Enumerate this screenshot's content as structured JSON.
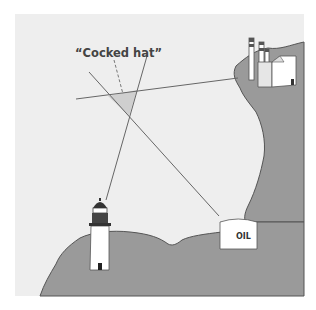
{
  "diagram": {
    "title_label": "“Cocked hat”",
    "oil_label": "OIL",
    "landmarks": [
      "lighthouse",
      "oil-tank",
      "power-station-chimneys"
    ],
    "colors": {
      "sea": "#eeeeee",
      "land": "#9a9a9a",
      "coast_line": "#555555",
      "bearing_line": "#666666",
      "cocked_hat_fill": "#cfcfcf",
      "label_text": "#444444"
    }
  }
}
